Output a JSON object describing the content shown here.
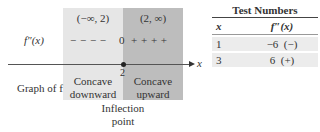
{
  "diagram": {
    "intervals": [
      "(−∞, 2)",
      "(2, ∞)"
    ],
    "second_derivative_label": "f″(x)",
    "sign_row": {
      "left": "− − − −",
      "zero": "0",
      "right": "+ + + +"
    },
    "axis": {
      "variable": "x",
      "point_label": "2"
    },
    "graph_label": "Graph of f",
    "concavity": {
      "left_line1": "Concave",
      "left_line2": "downward",
      "right_line1": "Concave",
      "right_line2": "upward"
    },
    "inflection_label_line1": "Inflection",
    "inflection_label_line2": "point",
    "colors": {
      "left_region": "#e6e6e6",
      "right_region": "#bdbdbd"
    }
  },
  "test_table": {
    "title": "Test Numbers",
    "headers": [
      "x",
      "f″(x)"
    ],
    "rows": [
      {
        "x": "1",
        "value": "−6",
        "sign": "(−)"
      },
      {
        "x": "3",
        "value": "6",
        "sign": "(+)"
      }
    ]
  }
}
